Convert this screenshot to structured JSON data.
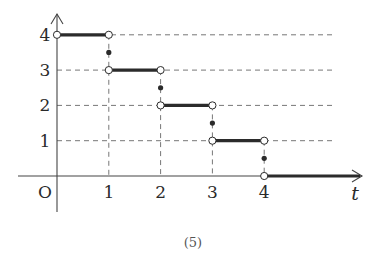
{
  "chart_data": {
    "type": "line",
    "subtype": "step-function",
    "title": "",
    "caption": "(5)",
    "xlabel": "t",
    "ylabel": "",
    "origin_label": "O",
    "x_ticks": [
      "1",
      "2",
      "3",
      "4"
    ],
    "y_ticks": [
      "1",
      "2",
      "3",
      "4"
    ],
    "xlim": [
      0,
      5.4
    ],
    "ylim": [
      0,
      4.4
    ],
    "grid": "dashed guide lines at integer levels",
    "segments": [
      {
        "x_start": 0,
        "x_end": 1,
        "y": 4,
        "start_open": true,
        "end_open": true
      },
      {
        "x_start": 1,
        "x_end": 2,
        "y": 3,
        "start_open": true,
        "end_open": true
      },
      {
        "x_start": 2,
        "x_end": 3,
        "y": 2,
        "start_open": true,
        "end_open": true
      },
      {
        "x_start": 3,
        "x_end": 4,
        "y": 1,
        "start_open": true,
        "end_open": true
      },
      {
        "x_start": 4,
        "x_end": 5.4,
        "y": 0,
        "start_open": true,
        "end_open": false
      }
    ],
    "point_values": [
      {
        "x": 1,
        "y": 3.5
      },
      {
        "x": 2,
        "y": 2.5
      },
      {
        "x": 3,
        "y": 1.5
      },
      {
        "x": 4,
        "y": 0.5
      }
    ]
  },
  "colors": {
    "line": "#2b2b2b",
    "axis": "#444444",
    "dash": "#777777",
    "open_fill": "#ffffff"
  }
}
